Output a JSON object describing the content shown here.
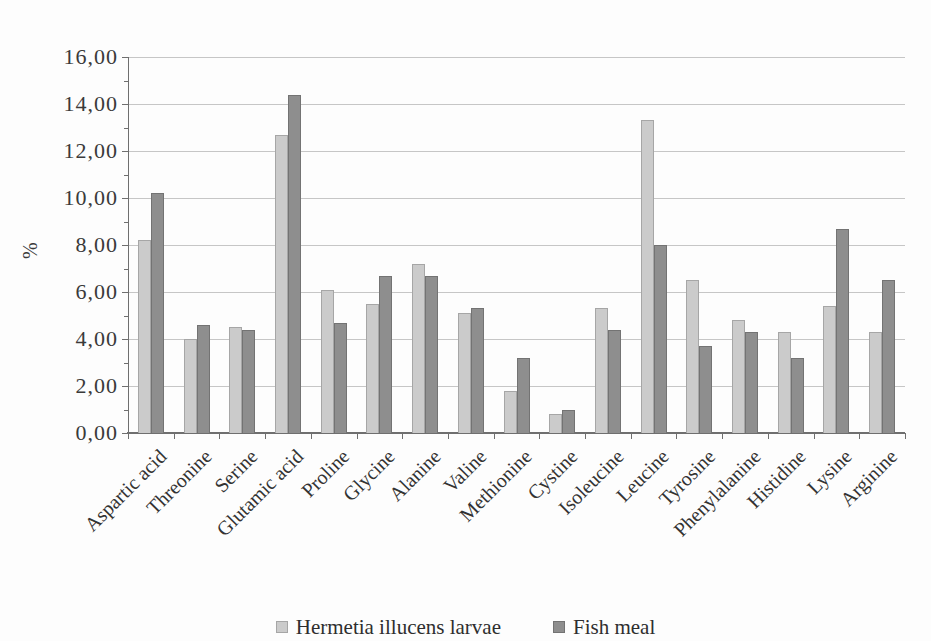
{
  "chart_data": {
    "type": "bar",
    "title": "",
    "xlabel": "",
    "ylabel": "%",
    "ylim": [
      0,
      16
    ],
    "ytick_step": 2,
    "yminor_step": 1,
    "grid": true,
    "legend_position": "bottom",
    "decimal_separator": ",",
    "ytick_labels": [
      "0,00",
      "2,00",
      "4,00",
      "6,00",
      "8,00",
      "10,00",
      "12,00",
      "14,00",
      "16,00"
    ],
    "categories": [
      "Aspartic acid",
      "Threonine",
      "Serine",
      "Glutamic acid",
      "Proline",
      "Glycine",
      "Alanine",
      "Valine",
      "Methionine",
      "Cystine",
      "Isoleucine",
      "Leucine",
      "Tyrosine",
      "Phenylalanine",
      "Histidine",
      "Lysine",
      "Arginine"
    ],
    "series": [
      {
        "name": "Hermetia illucens larvae",
        "color": "#cbcbcb",
        "border_color": "#a6a6a6",
        "values": [
          8.2,
          4.0,
          4.5,
          12.7,
          6.1,
          5.5,
          7.2,
          5.1,
          1.8,
          0.8,
          5.3,
          13.3,
          6.5,
          4.8,
          4.3,
          5.4,
          4.3
        ]
      },
      {
        "name": "Fish meal",
        "color": "#8e8e8e",
        "border_color": "#737373",
        "values": [
          10.2,
          4.6,
          4.4,
          14.4,
          4.7,
          6.7,
          6.7,
          5.3,
          3.2,
          1.0,
          4.4,
          8.0,
          3.7,
          4.3,
          3.2,
          8.7,
          6.5
        ]
      }
    ],
    "colors": {
      "grid": "#c6c6c6",
      "axis": "#6f6f6f",
      "text": "#333333",
      "background": "#fdfdfd"
    }
  }
}
